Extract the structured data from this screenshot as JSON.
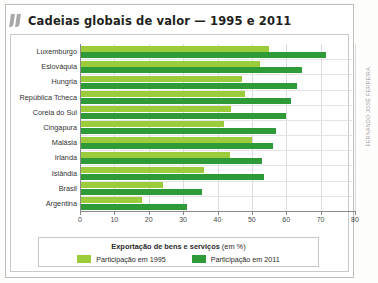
{
  "figure": {
    "title": "Cadeias globais de valor — 1995 e 2011",
    "credit": "FERNANDO JOSÉ FERREIRA",
    "quote_icon": "quote-mark-icon"
  },
  "legend": {
    "title_bold": "Exportação de bens e serviços",
    "title_rest": " (em %)",
    "items": [
      {
        "label": "Participação em 1995",
        "color": "#9ccb3b"
      },
      {
        "label": "Participação em 2011",
        "color": "#2f9b38"
      }
    ]
  },
  "chart_data": {
    "type": "bar",
    "orientation": "horizontal",
    "title": "Cadeias globais de valor — 1995 e 2011",
    "xlabel": "",
    "ylabel": "",
    "xlim": [
      0,
      80
    ],
    "xticks": [
      0,
      10,
      20,
      30,
      40,
      50,
      60,
      70,
      80
    ],
    "grid": true,
    "legend_position": "bottom",
    "categories": [
      "Luxemburgo",
      "Eslováquia",
      "Hungria",
      "República Tcheca",
      "Coreia do Sul",
      "Cingapura",
      "Malásia",
      "Irlanda",
      "Islândia",
      "Brasil",
      "Argentina"
    ],
    "series": [
      {
        "name": "Participação em 1995",
        "color": "#9ccb3b",
        "values": [
          55,
          52.5,
          47,
          48,
          44,
          42,
          50,
          43.5,
          36,
          24,
          18
        ]
      },
      {
        "name": "Participação em 2011",
        "color": "#2f9b38",
        "values": [
          71.5,
          64.5,
          63,
          61.5,
          60,
          57,
          56,
          53,
          53.5,
          35.5,
          31
        ]
      }
    ]
  }
}
